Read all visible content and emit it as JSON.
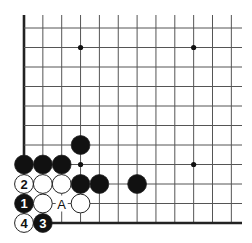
{
  "diagram": {
    "type": "go-board-problem",
    "board_region": "lower-left corner",
    "columns": 12,
    "rows": 11,
    "edges": [
      "left",
      "bottom"
    ],
    "colors": {
      "background": "#ffffff",
      "grid": "#555555",
      "edge": "#222222",
      "black_stone": "#111111",
      "white_stone": "#ffffff",
      "stone_outline": "#222222"
    },
    "star_points": [
      {
        "col": 3,
        "row": 1
      },
      {
        "col": 9,
        "row": 1
      },
      {
        "col": 3,
        "row": 7
      },
      {
        "col": 9,
        "row": 7
      }
    ],
    "stones": [
      {
        "col": 3,
        "row": 6,
        "color": "black",
        "label": ""
      },
      {
        "col": 0,
        "row": 7,
        "color": "black",
        "label": ""
      },
      {
        "col": 1,
        "row": 7,
        "color": "black",
        "label": ""
      },
      {
        "col": 2,
        "row": 7,
        "color": "black",
        "label": ""
      },
      {
        "col": 0,
        "row": 8,
        "color": "white",
        "label": "2"
      },
      {
        "col": 1,
        "row": 8,
        "color": "white",
        "label": ""
      },
      {
        "col": 2,
        "row": 8,
        "color": "white",
        "label": ""
      },
      {
        "col": 3,
        "row": 8,
        "color": "black",
        "label": ""
      },
      {
        "col": 4,
        "row": 8,
        "color": "black",
        "label": ""
      },
      {
        "col": 6,
        "row": 8,
        "color": "black",
        "label": ""
      },
      {
        "col": 0,
        "row": 9,
        "color": "black",
        "label": "1"
      },
      {
        "col": 1,
        "row": 9,
        "color": "white",
        "label": ""
      },
      {
        "col": 3,
        "row": 9,
        "color": "white",
        "label": ""
      },
      {
        "col": 0,
        "row": 10,
        "color": "white",
        "label": "4"
      },
      {
        "col": 1,
        "row": 10,
        "color": "black",
        "label": "3"
      }
    ],
    "markers": [
      {
        "col": 2,
        "row": 9,
        "label": "A"
      }
    ]
  }
}
